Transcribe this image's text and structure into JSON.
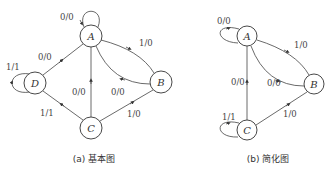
{
  "diagrams": {
    "basic": {
      "caption": "(a) 基本图",
      "nodes": [
        {
          "id": "A",
          "label": "A"
        },
        {
          "id": "B",
          "label": "B"
        },
        {
          "id": "C",
          "label": "C"
        },
        {
          "id": "D",
          "label": "D"
        }
      ],
      "edges": [
        {
          "from": "A",
          "to": "A",
          "label": "0/0"
        },
        {
          "from": "A",
          "to": "B",
          "label": "1/0"
        },
        {
          "from": "B",
          "to": "A",
          "label": "0/0"
        },
        {
          "from": "C",
          "to": "A",
          "label": "0/0"
        },
        {
          "from": "D",
          "to": "A",
          "label": "0/0"
        },
        {
          "from": "D",
          "to": "D",
          "label": "1/1"
        },
        {
          "from": "C",
          "to": "D",
          "label": "1/1"
        },
        {
          "from": "B",
          "to": "C",
          "label": "1/0"
        }
      ]
    },
    "simplified": {
      "caption": "(b) 简化图",
      "nodes": [
        {
          "id": "A",
          "label": "A"
        },
        {
          "id": "B",
          "label": "B"
        },
        {
          "id": "C",
          "label": "C"
        }
      ],
      "edges": [
        {
          "from": "A",
          "to": "A",
          "label": "0/0"
        },
        {
          "from": "A",
          "to": "B",
          "label": "1/0"
        },
        {
          "from": "B",
          "to": "A",
          "label": "0/0"
        },
        {
          "from": "C",
          "to": "A",
          "label": "0/0"
        },
        {
          "from": "C",
          "to": "C",
          "label": "1/1"
        },
        {
          "from": "B",
          "to": "C",
          "label": "1/0"
        }
      ]
    }
  }
}
